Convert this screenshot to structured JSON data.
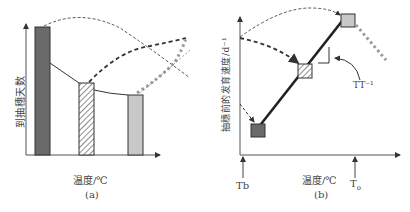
{
  "panel_a": {
    "caption": "(a)",
    "xlabel": "温度/℃",
    "ylabel": "到抽穗天数",
    "bars": [
      {
        "name": "low-temperature",
        "fill": "#6a6a6a",
        "pattern": "solid-dark"
      },
      {
        "name": "mid-temperature",
        "fill": "#ffffff",
        "pattern": "diagonal-hatch"
      },
      {
        "name": "high-temperature",
        "fill": "#c8c8c8",
        "pattern": "solid-light"
      }
    ]
  },
  "panel_b": {
    "caption": "(b)",
    "xlabel": "温度/℃",
    "ylabel": "抽穗前的发育速度/d⁻¹",
    "slope_label": "TT⁻¹",
    "x_marker_base": "Tb",
    "x_marker_opt": "T",
    "x_marker_opt_sub": "o",
    "points": [
      {
        "name": "low-temperature",
        "fill": "#6a6a6a",
        "pattern": "solid-dark"
      },
      {
        "name": "mid-temperature",
        "fill": "#ffffff",
        "pattern": "diagonal-hatch"
      },
      {
        "name": "high-temperature",
        "fill": "#c8c8c8",
        "pattern": "solid-light"
      }
    ]
  }
}
